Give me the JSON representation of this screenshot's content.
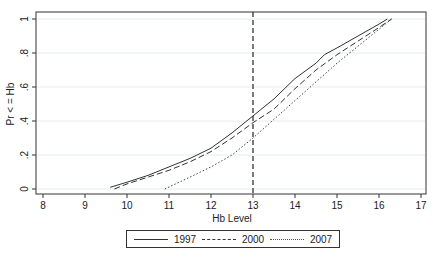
{
  "chart_data": {
    "type": "line",
    "title": "",
    "xlabel": "Hb Level",
    "ylabel": "Pr < = Hb",
    "xlim": [
      8,
      17
    ],
    "ylim": [
      0,
      1
    ],
    "x_ticks": [
      "8",
      "9",
      "10",
      "11",
      "12",
      "13",
      "14",
      "15",
      "16",
      "17"
    ],
    "y_ticks": [
      "0",
      ".2",
      ".4",
      ".6",
      ".8",
      "1"
    ],
    "grid": "horizontal",
    "reference_line": {
      "x": 13,
      "style": "dashed"
    },
    "legend_position": "bottom",
    "series": [
      {
        "name": "1997",
        "style": "solid",
        "x": [
          9.6,
          10.0,
          10.5,
          11.0,
          11.5,
          12.0,
          12.5,
          13.0,
          13.5,
          14.0,
          14.5,
          14.7,
          15.0,
          15.5,
          16.0,
          16.2
        ],
        "y": [
          0.01,
          0.04,
          0.08,
          0.13,
          0.18,
          0.24,
          0.33,
          0.43,
          0.53,
          0.65,
          0.74,
          0.79,
          0.83,
          0.9,
          0.97,
          1.0
        ]
      },
      {
        "name": "2000",
        "style": "dashed",
        "x": [
          9.7,
          10.0,
          10.5,
          11.0,
          11.5,
          12.0,
          12.5,
          13.0,
          13.5,
          14.0,
          14.5,
          15.0,
          15.5,
          16.0,
          16.3
        ],
        "y": [
          0.0,
          0.03,
          0.07,
          0.11,
          0.16,
          0.22,
          0.3,
          0.39,
          0.47,
          0.59,
          0.7,
          0.79,
          0.87,
          0.95,
          1.0
        ]
      },
      {
        "name": "2007",
        "style": "dotted",
        "x": [
          10.9,
          11.5,
          12.0,
          12.5,
          13.0,
          13.5,
          14.0,
          14.5,
          15.0,
          15.5,
          16.0,
          16.3
        ],
        "y": [
          0.0,
          0.07,
          0.13,
          0.2,
          0.3,
          0.41,
          0.52,
          0.63,
          0.74,
          0.84,
          0.94,
          1.0
        ]
      }
    ]
  },
  "legend": {
    "items": [
      {
        "label": "1997"
      },
      {
        "label": "2000"
      },
      {
        "label": "2007"
      }
    ]
  }
}
